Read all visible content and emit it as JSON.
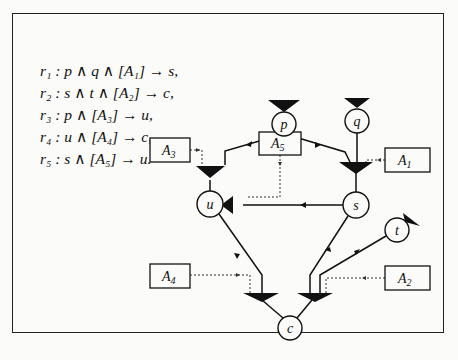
{
  "rules": [
    {
      "id": "r1",
      "label": "r₁ : p ∧ q ∧ [A₁] → s,"
    },
    {
      "id": "r2",
      "label": "r₂ : s ∧ t ∧ [A₂] → c,"
    },
    {
      "id": "r3",
      "label": "r₃ : p ∧ [A₃] → u,"
    },
    {
      "id": "r4",
      "label": "r₄ : u ∧ [A₄] → c,"
    },
    {
      "id": "r5",
      "label": "r₅ : s ∧ [A₅] → u."
    }
  ],
  "diagram": {
    "nodes": [
      {
        "id": "p",
        "label": "p",
        "x": 284,
        "y": 131
      },
      {
        "id": "q",
        "label": "q",
        "x": 357,
        "y": 121
      },
      {
        "id": "u",
        "label": "u",
        "x": 210,
        "y": 204
      },
      {
        "id": "s",
        "label": "s",
        "x": 356,
        "y": 205
      },
      {
        "id": "t",
        "label": "t",
        "x": 397,
        "y": 230
      },
      {
        "id": "c",
        "label": "c",
        "x": 290,
        "y": 328
      }
    ],
    "condition_boxes": [
      {
        "id": "A1",
        "label": "A",
        "sub": "1"
      },
      {
        "id": "A2",
        "label": "A",
        "sub": "2"
      },
      {
        "id": "A3",
        "label": "A",
        "sub": "3"
      },
      {
        "id": "A4",
        "label": "A",
        "sub": "4"
      },
      {
        "id": "A5",
        "label": "A",
        "sub": "5"
      }
    ]
  },
  "colors": {
    "ink": "#111111",
    "paper": "#fbfbf9"
  }
}
